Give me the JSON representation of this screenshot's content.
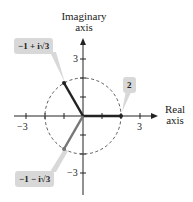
{
  "axes": {
    "y_label_line1": "Imaginary",
    "y_label_line2": "axis",
    "x_label_line1": "Real",
    "x_label_line2": "axis",
    "ticks": {
      "x_pos": "3",
      "x_neg": "−3",
      "y_pos": "3",
      "y_neg": "−3"
    }
  },
  "circle": {
    "radius": 2,
    "style": "dashed"
  },
  "points": [
    {
      "label": "2",
      "re": 2,
      "im": 0
    },
    {
      "label": "−1 + i√3",
      "re": -1,
      "im": 1.732
    },
    {
      "label": "−1 − i√3",
      "re": -1,
      "im": -1.732
    }
  ],
  "colors": {
    "callout_bg": "#d8d8d8",
    "vector_dark": "#222222",
    "vector_gray": "#777777"
  }
}
